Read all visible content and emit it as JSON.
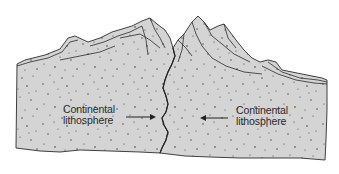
{
  "diagram": {
    "type": "continental-continental collision cross-section",
    "colors": {
      "background": "#ffffff",
      "crust_fill": "#d4d4d4",
      "outline": "#2b2b2b",
      "speckle": "#3a3a3a",
      "text": "#2a2a2a"
    },
    "labels": {
      "left": {
        "line1": "Continental",
        "line2": "lithosphere",
        "arrow_direction": "right"
      },
      "right": {
        "line1": "Continental",
        "line2": "lithosphere",
        "arrow_direction": "left"
      }
    }
  }
}
